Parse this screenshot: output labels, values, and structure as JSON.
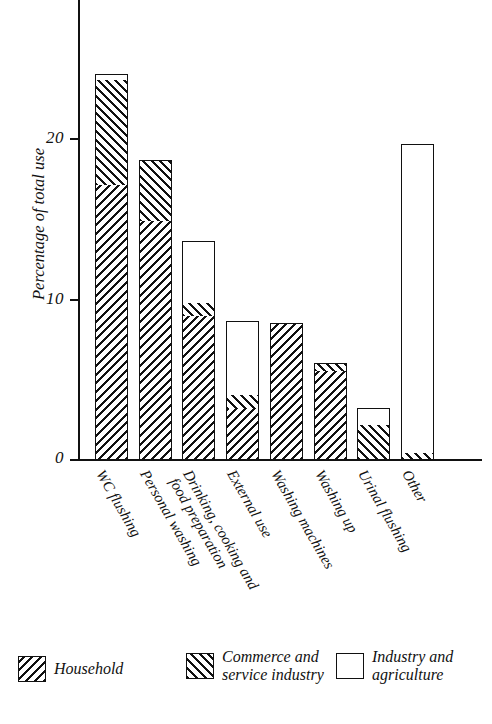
{
  "chart_data": {
    "type": "bar",
    "stacked": true,
    "title": "",
    "xlabel": "",
    "ylabel": "Percentage of total use",
    "ylim": [
      0,
      26
    ],
    "yticks": [
      0,
      10,
      20
    ],
    "ytick_labels": [
      "0",
      "10",
      "20"
    ],
    "grid": false,
    "legend_position": "bottom",
    "categories": [
      "WC flushing",
      "Personal washing",
      "Drinking, cooking and\nfood preparation",
      "External use",
      "Washing machines",
      "Washing up",
      "Urinal flushing",
      "Other"
    ],
    "series": [
      {
        "name": "Household",
        "swatch": "backslash-hatch",
        "values": [
          17.1,
          14.8,
          8.9,
          3.1,
          8.5,
          5.5,
          0.0,
          0.0
        ]
      },
      {
        "name": "Commerce and service industry",
        "swatch": "forward-hatch",
        "values": [
          6.5,
          3.8,
          0.8,
          0.9,
          0.0,
          0.5,
          2.1,
          0.4
        ]
      },
      {
        "name": "Industry and agriculture",
        "swatch": "empty-box",
        "values": [
          0.4,
          0.0,
          3.9,
          4.6,
          0.0,
          0.0,
          1.1,
          19.2
        ]
      }
    ],
    "totals": [
      24.0,
      18.6,
      13.6,
      8.6,
      8.5,
      6.0,
      3.2,
      19.6
    ]
  },
  "axis": {
    "y_title": "Percentage of total use",
    "ticks": [
      {
        "label": "20",
        "value": 20
      },
      {
        "label": "10",
        "value": 10
      },
      {
        "label": "0",
        "value": 0
      }
    ]
  },
  "legend": {
    "items": [
      {
        "label": "Household",
        "style": "backslash-hatch"
      },
      {
        "label": "Commerce and\nservice industry",
        "style": "forward-hatch"
      },
      {
        "label": "Industry and\nagriculture",
        "style": "empty-box"
      }
    ]
  },
  "colors": {
    "ink": "#111111",
    "background": "#ffffff"
  }
}
